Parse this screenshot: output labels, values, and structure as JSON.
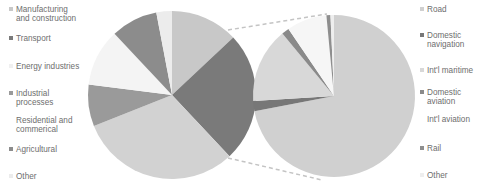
{
  "chart_data": [
    {
      "type": "pie",
      "title": "",
      "name": "Emissions by sector",
      "categories": [
        "Manufacturing and construction",
        "Transport",
        "Residential and commerical",
        "Industrial processes",
        "Energy industries",
        "Agricultural",
        "Other"
      ],
      "values": [
        13,
        25,
        31,
        8,
        11,
        9,
        3
      ],
      "colors": [
        "#c8c8c8",
        "#7a7a7a",
        "#d2d2d2",
        "#9a9a9a",
        "#f4f4f4",
        "#8c8c8c",
        "#ececec"
      ],
      "legend_position": "left",
      "exploded_slice": "Transport"
    },
    {
      "type": "pie",
      "title": "",
      "name": "Transport breakdown",
      "categories": [
        "Road",
        "Domestic navigation",
        "Int'l maritime",
        "Domestic aviation",
        "Int'l aviation",
        "Rail",
        "Other"
      ],
      "values": [
        72,
        2,
        15,
        1.5,
        8,
        0.8,
        0.7
      ],
      "colors": [
        "#d0d0d0",
        "#777777",
        "#d8d8d8",
        "#8a8a8a",
        "#f6f6f6",
        "#8e8e8e",
        "#eeeeee"
      ],
      "legend_position": "right",
      "connector": "dashed lines from Transport slice"
    }
  ],
  "legend_left": [
    {
      "label": "Manufacturing",
      "label2": "and construction",
      "color": "#c8c8c8"
    },
    {
      "label": "Transport",
      "label2": "",
      "color": "#7a7a7a"
    },
    {
      "label": "Energy industries",
      "label2": "",
      "color": "#f0f0f0"
    },
    {
      "label": "Industrial",
      "label2": "processes",
      "color": "#9a9a9a"
    },
    {
      "label": "Residential and",
      "label2": "commerical",
      "color": "#d2d2d2"
    },
    {
      "label": "Agricultural",
      "label2": "",
      "color": "#8c8c8c"
    },
    {
      "label": "Other",
      "label2": "",
      "color": "#ececec"
    }
  ],
  "legend_right": [
    {
      "label": "Road",
      "label2": "",
      "color": "#d0d0d0"
    },
    {
      "label": "Domestic",
      "label2": "navigation",
      "color": "#777777"
    },
    {
      "label": "Int'l maritime",
      "label2": "",
      "color": "#d8d8d8"
    },
    {
      "label": "Domestic",
      "label2": "aviation",
      "color": "#8a8a8a"
    },
    {
      "label": "Int'l aviation",
      "label2": "",
      "color": "#f6f6f6"
    },
    {
      "label": "Rail",
      "label2": "",
      "color": "#8e8e8e"
    },
    {
      "label": "Other",
      "label2": "",
      "color": "#eeeeee"
    }
  ]
}
